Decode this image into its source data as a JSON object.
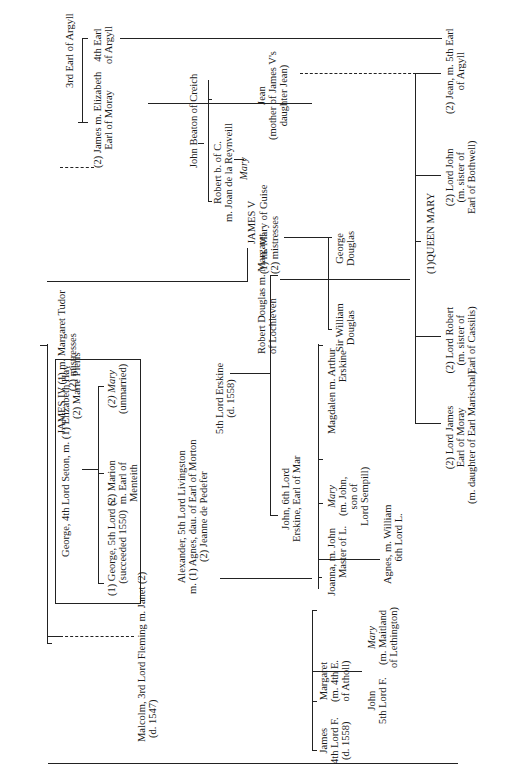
{
  "people": {
    "james_iv": "JAMES IV (1) m. Margaret Tudor",
    "james_iv_sub": "(2)        mistresses",
    "seton_father": "George, 4th Lord Seton, m. (1) Elizabeth Hay",
    "seton_father_2": "(2) Marie Pieris",
    "seton_george": [
      "(1) George, 5th Lord S.",
      "(succeeded 1550)"
    ],
    "seton_marion": [
      "(2) Marion",
      "m. Earl of",
      "Menteith"
    ],
    "seton_mary": [
      "(2) Mary",
      "(unmarried)"
    ],
    "fleming": [
      "Malcolm, 3rd Lord Fleming m. Janet (2)",
      "(d. 1547)"
    ],
    "fleming_james": [
      "James",
      "4th Lord F.",
      "(d. 1558)"
    ],
    "fleming_john": [
      "John",
      "5th Lord F."
    ],
    "fleming_margaret": [
      "Margaret",
      "(m. 4th E.",
      "of Atholl)"
    ],
    "fleming_mary": [
      "Mary",
      "(m. Maitland",
      "of Lethington)"
    ],
    "livingston": [
      "Alexander, 5th Lord Livingston",
      "m. (1) Agnes, dau. of Earl of Morton",
      "(2) Jeanne de Pedefer"
    ],
    "livingston_joanna": [
      "Joanna, m. John",
      "Master of L."
    ],
    "livingston_agnes": [
      "Agnes, m. William",
      "6th Lord L."
    ],
    "livingston_mary": [
      "Mary",
      "(m. John,",
      "son of",
      "Lord Sempill)"
    ],
    "livingston_magdalen": [
      "Magdalen m. Arthur",
      "Erskine"
    ],
    "erskine": [
      "5th Lord Erskine",
      "(d. 1558)"
    ],
    "erskine_john": [
      "John, 6th Lord",
      "Erskine, Earl of Mar"
    ],
    "douglas": [
      "Robert Douglas  m.  Margaret",
      "of Lochleven"
    ],
    "douglas_william": [
      "Sir William",
      "Douglas"
    ],
    "douglas_george": [
      "George",
      "Douglas"
    ],
    "james_v": "JAMES V",
    "james_v_m1": "(1) m. Mary of Guise",
    "james_v_m2": "(2)        mistresses",
    "beaton": "John Beaton of Creich",
    "beaton_robert": [
      "Robert b. of C.",
      "m. Joan de la Reynveill"
    ],
    "beaton_mary": "Mary",
    "argyll3": "3rd Earl of Argyll",
    "argyll4": [
      "4th Earl",
      "of Argyll"
    ],
    "argyll_elizabeth": [
      "(2) James m. Elizabeth",
      "Earl of Moray"
    ],
    "jean_mother": [
      "Jean",
      "(mother of James V's",
      "daughter Jean)"
    ],
    "queen_mary": "(1)QUEEN MARY",
    "lord_james": [
      "(2) Lord James",
      "Earl of Moray",
      "(m. daughter of Earl Marischal)"
    ],
    "lord_robert": [
      "(2) Lord Robert",
      "(m. sister of",
      "Earl of Cassilis)"
    ],
    "lord_john": [
      "(2) Lord John",
      "(m. sister of",
      "Earl of Bothwell)"
    ],
    "jean": [
      "(2) Jean, m. 5th Earl",
      "of Argyll"
    ]
  }
}
